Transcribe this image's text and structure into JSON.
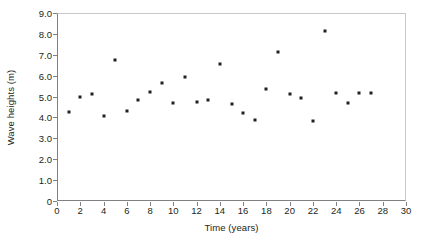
{
  "chart_data": {
    "type": "scatter",
    "title": "",
    "xlabel": "Time (years)",
    "ylabel": "Wave heights (m)",
    "xlim": [
      0,
      30
    ],
    "ylim": [
      0,
      9.0
    ],
    "xticks": [
      "0",
      "2",
      "4",
      "6",
      "8",
      "10",
      "12",
      "14",
      "16",
      "18",
      "20",
      "22",
      "24",
      "26",
      "28",
      "30"
    ],
    "xtick_values": [
      0,
      2,
      4,
      6,
      8,
      10,
      12,
      14,
      16,
      18,
      20,
      22,
      24,
      26,
      28,
      30
    ],
    "yticks": [
      "0",
      "1.0",
      "2.0",
      "3.0",
      "4.0",
      "5.0",
      "6.0",
      "7.0",
      "8.0",
      "9.0"
    ],
    "ytick_values": [
      0,
      1.0,
      2.0,
      3.0,
      4.0,
      5.0,
      6.0,
      7.0,
      8.0,
      9.0
    ],
    "grid": false,
    "legend": null,
    "marker_color": "#231f20",
    "axis_color": "#808184",
    "x": [
      1,
      2,
      3,
      4,
      5,
      6,
      7,
      8,
      9,
      10,
      11,
      12,
      13,
      14,
      15,
      16,
      17,
      18,
      19,
      20,
      21,
      22,
      23,
      24,
      25,
      26,
      27
    ],
    "values": [
      4.25,
      5.0,
      5.1,
      4.05,
      6.75,
      4.3,
      4.85,
      5.2,
      5.65,
      4.7,
      5.95,
      4.75,
      4.85,
      6.55,
      4.65,
      4.2,
      3.9,
      5.35,
      7.15,
      5.1,
      4.95,
      3.85,
      8.15,
      5.15,
      4.7,
      5.15,
      5.15
    ],
    "points": [
      {
        "x": 1,
        "y": 4.25
      },
      {
        "x": 2,
        "y": 5.0
      },
      {
        "x": 3,
        "y": 5.1
      },
      {
        "x": 4,
        "y": 4.05
      },
      {
        "x": 5,
        "y": 6.75
      },
      {
        "x": 6,
        "y": 4.3
      },
      {
        "x": 7,
        "y": 4.85
      },
      {
        "x": 8,
        "y": 5.2
      },
      {
        "x": 9,
        "y": 5.65
      },
      {
        "x": 10,
        "y": 4.7
      },
      {
        "x": 11,
        "y": 5.95
      },
      {
        "x": 12,
        "y": 4.75
      },
      {
        "x": 13,
        "y": 4.85
      },
      {
        "x": 14,
        "y": 6.55
      },
      {
        "x": 15,
        "y": 4.65
      },
      {
        "x": 16,
        "y": 4.2
      },
      {
        "x": 17,
        "y": 3.9
      },
      {
        "x": 18,
        "y": 5.35
      },
      {
        "x": 19,
        "y": 7.15
      },
      {
        "x": 20,
        "y": 5.1
      },
      {
        "x": 21,
        "y": 4.95
      },
      {
        "x": 22,
        "y": 3.85
      },
      {
        "x": 23,
        "y": 8.15
      },
      {
        "x": 24,
        "y": 5.15
      },
      {
        "x": 25,
        "y": 4.7
      },
      {
        "x": 26,
        "y": 5.15
      },
      {
        "x": 27,
        "y": 5.15
      }
    ]
  }
}
